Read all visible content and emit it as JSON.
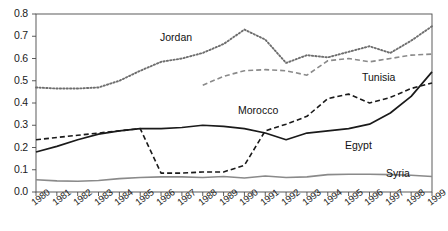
{
  "chart_data": {
    "type": "line",
    "title": "",
    "xlabel": "",
    "ylabel": "",
    "ylim": [
      0.0,
      0.8
    ],
    "ytick_step": 0.1,
    "grid": false,
    "legend_position": "inline-labels",
    "x": [
      1980,
      1981,
      1982,
      1983,
      1984,
      1985,
      1986,
      1987,
      1988,
      1989,
      1990,
      1991,
      1992,
      1993,
      1994,
      1995,
      1996,
      1997,
      1998,
      1999
    ],
    "ytick_labels": [
      "0.0",
      "0.1",
      "0.2",
      "0.3",
      "0.4",
      "0.5",
      "0.6",
      "0.7",
      "0.8"
    ],
    "xtick_labels": [
      "1980",
      "1981",
      "1982",
      "1983",
      "1984",
      "1985",
      "1986",
      "1987",
      "1988",
      "1989",
      "1990",
      "1991",
      "1992",
      "1993",
      "1994",
      "1995",
      "1996",
      "1997",
      "1998",
      "1999"
    ],
    "series": [
      {
        "name": "Jordan",
        "style": "dotted",
        "color": "#6e6e6e",
        "label_x": 160,
        "label_y": 31,
        "values": [
          0.47,
          0.465,
          0.465,
          0.47,
          0.5,
          0.545,
          0.585,
          0.6,
          0.625,
          0.665,
          0.73,
          0.685,
          0.58,
          0.615,
          0.605,
          0.63,
          0.655,
          0.625,
          0.68,
          0.745
        ]
      },
      {
        "name": "Tunisia",
        "style": "dashed",
        "color": "#8a8a8a",
        "label_x": 362,
        "label_y": 71,
        "values": [
          null,
          null,
          null,
          null,
          null,
          null,
          null,
          null,
          0.48,
          0.52,
          0.545,
          0.55,
          0.545,
          0.525,
          0.59,
          0.6,
          0.585,
          0.6,
          0.615,
          0.62
        ]
      },
      {
        "name": "Morocco",
        "style": "dashed",
        "color": "#1a1a1a",
        "label_x": 238,
        "label_y": 104,
        "values": [
          0.235,
          0.245,
          0.255,
          0.265,
          0.275,
          0.285,
          0.085,
          0.085,
          0.09,
          0.09,
          0.12,
          0.275,
          0.305,
          0.34,
          0.42,
          0.44,
          0.4,
          0.425,
          0.465,
          0.49
        ]
      },
      {
        "name": "Egypt",
        "style": "solid",
        "color": "#1a1a1a",
        "label_x": 345,
        "label_y": 139,
        "values": [
          0.18,
          0.205,
          0.235,
          0.26,
          0.275,
          0.285,
          0.285,
          0.29,
          0.3,
          0.295,
          0.285,
          0.265,
          0.235,
          0.265,
          0.275,
          0.285,
          0.305,
          0.355,
          0.43,
          0.54
        ]
      },
      {
        "name": "Syria",
        "style": "solid",
        "color": "#8a8a8a",
        "label_x": 386,
        "label_y": 167,
        "values": [
          0.055,
          0.05,
          0.048,
          0.052,
          0.06,
          0.065,
          0.068,
          0.068,
          0.065,
          0.07,
          0.063,
          0.072,
          0.065,
          0.068,
          0.078,
          0.08,
          0.08,
          0.078,
          0.075,
          0.07
        ]
      }
    ]
  }
}
